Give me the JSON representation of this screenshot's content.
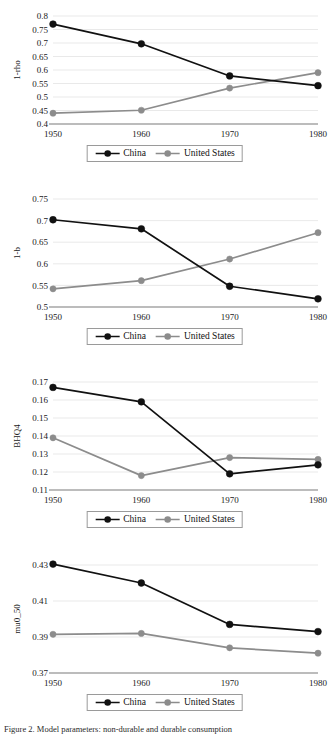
{
  "figure": {
    "background": "#ffffff",
    "width": 329,
    "height": 735,
    "caption": "Figure 2. Model parameters: non-durable and durable consumption"
  },
  "legend": {
    "series": [
      {
        "name": "China",
        "color": "#111111",
        "marker": "circle"
      },
      {
        "name": "United States",
        "color": "#8c8c8c",
        "marker": "circle"
      }
    ]
  },
  "chart_data": [
    {
      "type": "line",
      "id": "chart-1-rho",
      "title": "",
      "xlabel": "",
      "ylabel": "1-rho",
      "x": [
        1950,
        1960,
        1970,
        1980
      ],
      "xtick_labels": [
        "1950",
        "1960",
        "1970",
        "1980"
      ],
      "ylim": [
        0.4,
        0.8
      ],
      "yticks": [
        0.4,
        0.45,
        0.5,
        0.55,
        0.6,
        0.65,
        0.7,
        0.75,
        0.8
      ],
      "ytick_labels": [
        "0.4",
        "0.45",
        "0.5",
        "0.55",
        "0.6",
        "0.65",
        "0.7",
        "0.75",
        "0.8"
      ],
      "grid": true,
      "legend_position": "bottom",
      "series": [
        {
          "name": "China",
          "color": "#111111",
          "values": [
            0.77,
            0.697,
            0.578,
            0.542
          ]
        },
        {
          "name": "United States",
          "color": "#8c8c8c",
          "values": [
            0.44,
            0.451,
            0.533,
            0.59
          ]
        }
      ]
    },
    {
      "type": "line",
      "id": "chart-1-b",
      "title": "",
      "xlabel": "",
      "ylabel": "1-b",
      "x": [
        1950,
        1960,
        1970,
        1980
      ],
      "xtick_labels": [
        "1950",
        "1960",
        "1970",
        "1980"
      ],
      "ylim": [
        0.5,
        0.75
      ],
      "yticks": [
        0.5,
        0.55,
        0.6,
        0.65,
        0.7,
        0.75
      ],
      "ytick_labels": [
        "0.5",
        "0.55",
        "0.6",
        "0.65",
        "0.7",
        "0.75"
      ],
      "grid": true,
      "legend_position": "bottom",
      "series": [
        {
          "name": "China",
          "color": "#111111",
          "values": [
            0.702,
            0.681,
            0.548,
            0.519
          ]
        },
        {
          "name": "United States",
          "color": "#8c8c8c",
          "values": [
            0.542,
            0.561,
            0.611,
            0.672
          ]
        }
      ]
    },
    {
      "type": "line",
      "id": "chart-bhq4",
      "title": "",
      "xlabel": "",
      "ylabel": "BHQ4",
      "x": [
        1950,
        1960,
        1970,
        1980
      ],
      "xtick_labels": [
        "1950",
        "1960",
        "1970",
        "1980"
      ],
      "ylim": [
        0.11,
        0.17
      ],
      "yticks": [
        0.11,
        0.12,
        0.13,
        0.14,
        0.15,
        0.16,
        0.17
      ],
      "ytick_labels": [
        "0.11",
        "0.12",
        "0.13",
        "0.14",
        "0.15",
        "0.16",
        "0.17"
      ],
      "grid": true,
      "legend_position": "bottom",
      "series": [
        {
          "name": "China",
          "color": "#111111",
          "values": [
            0.167,
            0.159,
            0.119,
            0.124
          ]
        },
        {
          "name": "United States",
          "color": "#8c8c8c",
          "values": [
            0.139,
            0.118,
            0.128,
            0.127
          ]
        }
      ]
    },
    {
      "type": "line",
      "id": "chart-mu0-50",
      "title": "",
      "xlabel": "",
      "ylabel": "mu0_50",
      "x": [
        1950,
        1960,
        1970,
        1980
      ],
      "xtick_labels": [
        "1950",
        "1960",
        "1970",
        "1980"
      ],
      "ylim": [
        0.37,
        0.43
      ],
      "yticks": [
        0.37,
        0.39,
        0.41,
        0.43
      ],
      "ytick_labels": [
        "0.37",
        "0.39",
        "0.41",
        "0.43"
      ],
      "grid": true,
      "legend_position": "bottom",
      "series": [
        {
          "name": "China",
          "color": "#111111",
          "values": [
            0.4305,
            0.42,
            0.397,
            0.393
          ]
        },
        {
          "name": "United States",
          "color": "#8c8c8c",
          "values": [
            0.3915,
            0.392,
            0.384,
            0.381
          ]
        }
      ]
    }
  ]
}
